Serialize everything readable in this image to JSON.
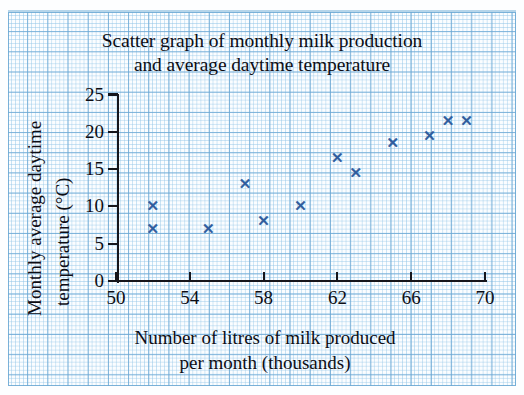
{
  "chart_data": {
    "type": "scatter",
    "title": "Scatter graph of monthly milk production and average daytime temperature",
    "title_lines": [
      "Scatter graph of monthly milk production",
      "and average daytime temperature"
    ],
    "xlabel": "Number of litres of milk produced per month (thousands)",
    "xlabel_lines": [
      "Number of litres of milk produced",
      "per month (thousands)"
    ],
    "ylabel": "Monthly average daytime temperature (°C)",
    "ylabel_lines": [
      "Monthly average daytime",
      "temperature (°C)"
    ],
    "xlim": [
      50,
      70
    ],
    "ylim": [
      0,
      25
    ],
    "xticks": [
      50,
      54,
      58,
      62,
      66,
      70
    ],
    "xtick_labels": [
      "50",
      "54",
      "58",
      "62",
      "66",
      "70"
    ],
    "yticks": [
      0,
      5,
      10,
      15,
      20,
      25
    ],
    "ytick_labels": [
      "0",
      "5",
      "10",
      "15",
      "20",
      "25"
    ],
    "grid": true,
    "grid_style": "graph-paper",
    "legend": null,
    "marker": "x",
    "marker_color": "#2c5a9c",
    "points": [
      {
        "x": 52,
        "y": 10
      },
      {
        "x": 52,
        "y": 7
      },
      {
        "x": 55,
        "y": 7
      },
      {
        "x": 57,
        "y": 13
      },
      {
        "x": 58,
        "y": 8
      },
      {
        "x": 60,
        "y": 10
      },
      {
        "x": 62,
        "y": 16.5
      },
      {
        "x": 63,
        "y": 14.5
      },
      {
        "x": 65,
        "y": 18.5
      },
      {
        "x": 67,
        "y": 19.5
      },
      {
        "x": 68,
        "y": 21.5
      },
      {
        "x": 69,
        "y": 21.5
      }
    ]
  },
  "colors": {
    "marker": "#2c5a9c",
    "axis": "#16161c",
    "text": "#0d0d14",
    "grid_major": "#6ca8d4",
    "grid_minor": "#96c8e8",
    "paper": "#fbfdff"
  }
}
